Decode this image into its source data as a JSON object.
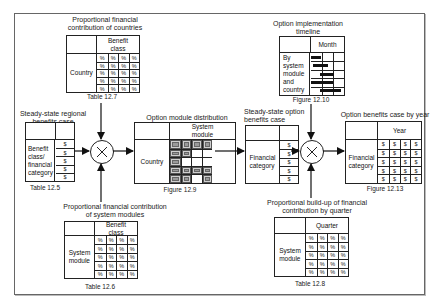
{
  "diagram": {
    "table_12_7": {
      "title_line1": "Proportional financial",
      "title_line2": "contribution of countries",
      "col_header_line1": "Benefit",
      "col_header_line2": "class",
      "row_label": "Country",
      "cell": "%",
      "rows": 5,
      "cols": 4,
      "caption": "Table 12.7"
    },
    "table_12_5": {
      "title_line1": "Steady-state regional",
      "title_line2": "benefits case",
      "row_label_lines": [
        "Benefit",
        "class/",
        "financial",
        "category"
      ],
      "cell": "$",
      "rows": 5,
      "caption": "Table 12.5"
    },
    "table_12_6": {
      "title_line1": "Proportional financial contribution",
      "title_line2": "of system modules",
      "col_header_line1": "Benefit",
      "col_header_line2": "class",
      "row_label_lines": [
        "System",
        "module"
      ],
      "cell": "%",
      "rows": 5,
      "cols": 4,
      "caption": "Table 12.6"
    },
    "figure_12_9": {
      "title": "Option module distribution",
      "col_header_line1": "System",
      "col_header_line2": "module",
      "row_label": "Country",
      "pattern": [
        [
          1,
          1,
          1,
          1
        ],
        [
          1,
          1,
          0,
          0
        ],
        [
          1,
          0,
          0,
          0
        ],
        [
          1,
          1,
          1,
          1
        ],
        [
          1,
          1,
          0,
          1
        ]
      ],
      "caption": "Figure 12.9"
    },
    "figure_12_10": {
      "title_line1": "Option implementation",
      "title_line2": "timeline",
      "col_header": "Month",
      "row_label_lines": [
        "By",
        "system",
        "module",
        "and",
        "country"
      ],
      "caption": "Figure 12.10"
    },
    "steady_state_option": {
      "title_line1": "Steady-state option",
      "title_line2": "benefits case",
      "row_label_lines": [
        "Financial",
        "category"
      ],
      "cell": "$",
      "rows": 5
    },
    "table_12_8": {
      "title_line1": "Proportional build-up of financial",
      "title_line2": "contribution by quarter",
      "col_header": "Quarter",
      "row_label_lines": [
        "System",
        "module"
      ],
      "cell": "%",
      "rows": 5,
      "cols": 4,
      "caption": "Table 12.8"
    },
    "figure_12_13": {
      "title": "Option benefits case by year",
      "col_header": "Year",
      "row_label_lines": [
        "Financial",
        "category"
      ],
      "cell": "$",
      "rows": 5,
      "cols": 4,
      "caption": "Figure 12.13"
    },
    "operators": [
      "multiply",
      "multiply"
    ]
  }
}
